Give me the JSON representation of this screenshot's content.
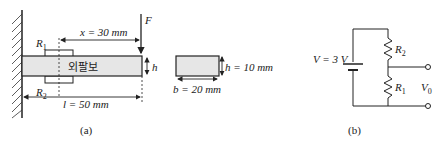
{
  "figure_a": {
    "caption": "(a)",
    "beam_label": "외팔보",
    "force_label": "F",
    "x_dim": "x = 30 mm",
    "l_dim": "l = 50 mm",
    "h_label": "h",
    "r1_label": "R",
    "r1_sub": "1",
    "r2_label": "R",
    "r2_sub": "2",
    "cross_section": {
      "h_dim": "h = 10 mm",
      "b_dim": "b = 20 mm"
    }
  },
  "figure_b": {
    "caption": "(b)",
    "voltage_label": "V = 3 V",
    "r1_label": "R",
    "r1_sub": "1",
    "r2_label": "R",
    "r2_sub": "2",
    "vo_label": "V",
    "vo_sub": "0"
  },
  "colors": {
    "line": "#222222",
    "beam_fill": "#e6e6e6"
  }
}
